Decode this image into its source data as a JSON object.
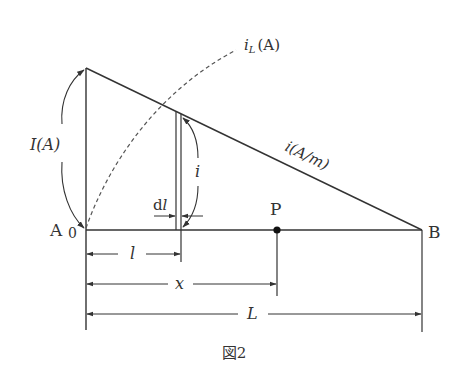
{
  "figure": {
    "caption": "図2",
    "labels": {
      "point_a": "A",
      "origin": "0",
      "point_b": "B",
      "point_p": "P",
      "total_current": "I(A)",
      "local_current_i": "i",
      "distributed_current": "i(A/m)",
      "load_current": "i",
      "load_current_sub": "L",
      "load_current_unit": "(A)",
      "dl": "dl",
      "dim_l": "l",
      "dim_x": "x",
      "dim_L": "L"
    }
  }
}
